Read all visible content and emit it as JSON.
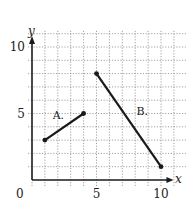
{
  "chart_data": {
    "type": "line",
    "title": "",
    "xlabel": "x",
    "ylabel": "y",
    "xlim": [
      0,
      11
    ],
    "ylim": [
      0,
      11
    ],
    "grid": true,
    "grid_style": "dotted",
    "x_ticks": [
      0,
      5,
      10
    ],
    "y_ticks": [
      5,
      10
    ],
    "origin_label": "0",
    "series": [
      {
        "name": "A.",
        "points": [
          [
            1,
            3
          ],
          [
            4,
            5
          ]
        ],
        "label_position": [
          1.6,
          4.6
        ]
      },
      {
        "name": "B.",
        "points": [
          [
            5,
            8
          ],
          [
            10,
            1
          ]
        ],
        "label_position": [
          8.1,
          4.9
        ]
      }
    ],
    "colors": {
      "line": "#1a1a1a",
      "grid": "#8a8a8a",
      "axis": "#1a1a1a"
    }
  },
  "labels": {
    "x_axis": "x",
    "y_axis": "y",
    "origin": "0",
    "x_tick_5": "5",
    "x_tick_10": "10",
    "y_tick_5": "5",
    "y_tick_10": "10",
    "segment_a": "A.",
    "segment_b": "B."
  }
}
